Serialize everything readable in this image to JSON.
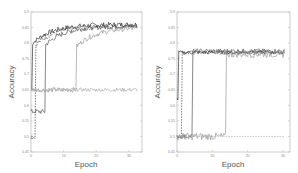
{
  "chart_data": [
    {
      "type": "line",
      "title": "",
      "xlabel": "Epoch",
      "ylabel": "Accuracy",
      "xlim": [
        0,
        34
      ],
      "ylim": [
        0.45,
        0.9
      ],
      "xticks": [
        0,
        10,
        20,
        30
      ],
      "yticks": [
        0.45,
        0.5,
        0.55,
        0.6,
        0.65,
        0.7,
        0.75,
        0.8,
        0.85,
        0.9
      ],
      "ytick_labels": [
        "0.45",
        "0.5",
        "0.55",
        "0.6",
        "0.65",
        "0.7",
        "0.75",
        "0.8",
        "0.85",
        "0.9"
      ],
      "grid": false,
      "legend": "none",
      "series": [
        {
          "name": "run-1",
          "color": "#333333",
          "dash": "solid",
          "jump_epoch": 0.5,
          "start": 0.65,
          "plateau": 0.86,
          "noise": 0.008
        },
        {
          "name": "run-2",
          "color": "#444444",
          "dash": "dashed",
          "jump_epoch": 1.5,
          "start": 0.5,
          "plateau": 0.855,
          "noise": 0.008
        },
        {
          "name": "run-3",
          "color": "#555555",
          "dash": "solid",
          "jump_epoch": 4.5,
          "start": 0.58,
          "plateau": 0.855,
          "noise": 0.008
        },
        {
          "name": "run-4",
          "color": "#999999",
          "dash": "solid",
          "jump_epoch": 14,
          "start": 0.65,
          "plateau": 0.85,
          "noise": 0.008
        },
        {
          "name": "run-5",
          "color": "#aaaaaa",
          "dash": "solid",
          "jump_epoch": null,
          "start": 0.65,
          "plateau": 0.65,
          "noise": 0.006
        }
      ]
    },
    {
      "type": "line",
      "title": "",
      "xlabel": "Epoch",
      "ylabel": "Accuracy",
      "xlim": [
        0,
        32
      ],
      "ylim": [
        0.45,
        0.9
      ],
      "xticks": [
        0,
        10,
        20,
        30
      ],
      "yticks": [
        0.45,
        0.5,
        0.55,
        0.6,
        0.65,
        0.7,
        0.75,
        0.8,
        0.85,
        0.9
      ],
      "ytick_labels": [
        "0.45",
        "0.5",
        "0.55",
        "0.6",
        "0.65",
        "0.7",
        "0.75",
        "0.8",
        "0.85",
        "0.9"
      ],
      "grid": false,
      "legend": "none",
      "series": [
        {
          "name": "run-1",
          "color": "#333333",
          "dash": "solid",
          "jump_epoch": 0.3,
          "start": 0.62,
          "plateau": 0.77,
          "noise": 0.006
        },
        {
          "name": "run-2",
          "color": "#444444",
          "dash": "dashed",
          "jump_epoch": 1.5,
          "start": 0.5,
          "plateau": 0.77,
          "noise": 0.007
        },
        {
          "name": "run-3",
          "color": "#555555",
          "dash": "solid",
          "jump_epoch": 4.5,
          "start": 0.5,
          "plateau": 0.775,
          "noise": 0.007
        },
        {
          "name": "run-4",
          "color": "#999999",
          "dash": "solid",
          "jump_epoch": 14,
          "start": 0.5,
          "plateau": 0.765,
          "noise": 0.012
        },
        {
          "name": "run-5",
          "color": "#aaaaaa",
          "dash": "dashed",
          "jump_epoch": null,
          "start": 0.5,
          "plateau": 0.5,
          "noise": 0.0
        }
      ]
    }
  ]
}
